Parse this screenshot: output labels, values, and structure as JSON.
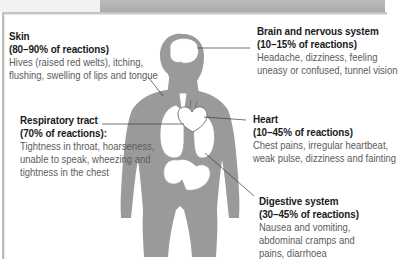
{
  "diagram": {
    "colors": {
      "silhouette": "#9a9a9a",
      "organ_fill": "#ffffff",
      "leader_line": "#3a3a3a",
      "title_text": "#1a1a1a",
      "desc_text": "#5c5c5c",
      "top_strip": "#b3b3b3"
    },
    "callouts": [
      {
        "id": "skin",
        "title": "Skin",
        "stat": "(80–90% of reactions)",
        "desc_lines": [
          "Hives (raised red welts), itching,",
          "flushing, swelling of lips and tongue"
        ]
      },
      {
        "id": "brain",
        "title": "Brain and nervous system",
        "stat": "(10–15% of reactions)",
        "desc_lines": [
          "Headache, dizziness, feeling",
          "uneasy or confused, tunnel vision"
        ]
      },
      {
        "id": "respiratory",
        "title": "Respiratory tract",
        "stat": "(70% of reactions):",
        "desc_lines": [
          "Tightness in throat, hoarseness,",
          "unable to speak, wheezing and",
          "tightness in the chest"
        ]
      },
      {
        "id": "heart",
        "title": "Heart",
        "stat": "(10–45% of reactions)",
        "desc_lines": [
          "Chest pains, irregular heartbeat,",
          "weak pulse, dizziness and fainting"
        ]
      },
      {
        "id": "digestive",
        "title": "Digestive system",
        "stat": "(30–45% of reactions)",
        "desc_lines": [
          "Nausea and vomiting,",
          "abdominal cramps and",
          "pains, diarrhoea"
        ]
      }
    ]
  }
}
